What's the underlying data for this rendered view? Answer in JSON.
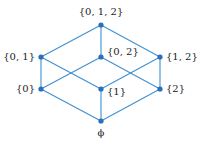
{
  "diagram": {
    "type": "hasse-diagram",
    "edge_color": "#3d8fd1",
    "node_color": "#2a6fb8",
    "nodes": [
      {
        "id": "top",
        "label": "{0, 1, 2}",
        "x": 101,
        "y": 25,
        "lx": 101,
        "ly": 15,
        "anchor": "middle"
      },
      {
        "id": "n01",
        "label": "{0, 1}",
        "x": 41,
        "y": 57,
        "lx": 35,
        "ly": 60,
        "anchor": "end"
      },
      {
        "id": "n02",
        "label": "{0, 2}",
        "x": 101,
        "y": 57,
        "lx": 107,
        "ly": 55,
        "anchor": "start"
      },
      {
        "id": "n12",
        "label": "{1, 2}",
        "x": 160,
        "y": 57,
        "lx": 166,
        "ly": 60,
        "anchor": "start"
      },
      {
        "id": "n0",
        "label": "{0}",
        "x": 41,
        "y": 89,
        "lx": 35,
        "ly": 92,
        "anchor": "end"
      },
      {
        "id": "n1",
        "label": "{1}",
        "x": 101,
        "y": 89,
        "lx": 107,
        "ly": 95,
        "anchor": "start"
      },
      {
        "id": "n2",
        "label": "{2}",
        "x": 160,
        "y": 89,
        "lx": 166,
        "ly": 92,
        "anchor": "start"
      },
      {
        "id": "empty",
        "label": "ϕ",
        "x": 101,
        "y": 121,
        "lx": 101,
        "ly": 136,
        "anchor": "middle"
      }
    ],
    "edges": [
      [
        "top",
        "n01"
      ],
      [
        "top",
        "n02"
      ],
      [
        "top",
        "n12"
      ],
      [
        "n01",
        "n0"
      ],
      [
        "n01",
        "n1"
      ],
      [
        "n02",
        "n0"
      ],
      [
        "n02",
        "n2"
      ],
      [
        "n12",
        "n1"
      ],
      [
        "n12",
        "n2"
      ],
      [
        "n0",
        "empty"
      ],
      [
        "n1",
        "empty"
      ],
      [
        "n2",
        "empty"
      ]
    ]
  }
}
